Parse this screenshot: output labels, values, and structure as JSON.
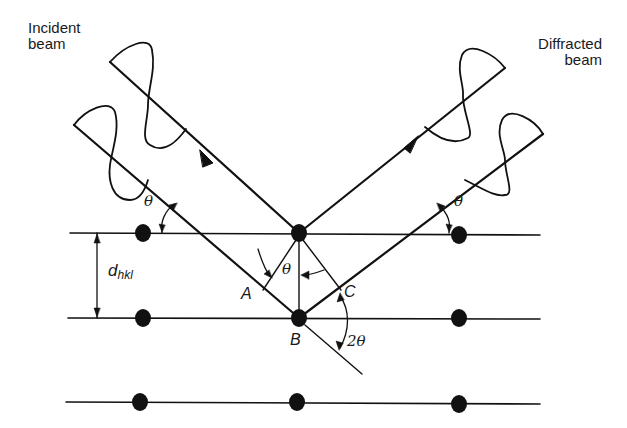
{
  "figure": {
    "colors": {
      "ink": "#111111",
      "background": "#ffffff"
    }
  },
  "labels": {
    "incident_beam_line1": "Incident",
    "incident_beam_line2": "beam",
    "diffracted_beam_line1": "Diffracted",
    "diffracted_beam_line2": "beam",
    "theta_left": "θ",
    "theta_right": "θ",
    "theta_center": "θ",
    "two_theta": "2θ",
    "point_a": "A",
    "point_b": "B",
    "point_c": "C",
    "d_spacing_main": "d",
    "d_spacing_sub": "hkl"
  },
  "lattice": {
    "planes": [
      {
        "y": 233,
        "x1": 70,
        "x2": 540
      },
      {
        "y": 318,
        "x1": 68,
        "x2": 540
      },
      {
        "y": 403,
        "x1": 66,
        "x2": 540
      }
    ],
    "atoms": [
      {
        "x": 143,
        "y": 233
      },
      {
        "x": 299,
        "y": 233
      },
      {
        "x": 459,
        "y": 235
      },
      {
        "x": 143,
        "y": 318
      },
      {
        "x": 299,
        "y": 318
      },
      {
        "x": 459,
        "y": 318
      },
      {
        "x": 140,
        "y": 402
      },
      {
        "x": 297,
        "y": 402
      },
      {
        "x": 459,
        "y": 404
      }
    ]
  },
  "beams": {
    "incident_outer": {
      "from": [
        74,
        125
      ],
      "to": [
        299,
        318
      ]
    },
    "incident_inner": {
      "from": [
        110,
        62
      ],
      "to": [
        299,
        233
      ]
    },
    "diffracted_inner": {
      "from": [
        299,
        233
      ],
      "to": [
        505,
        68
      ]
    },
    "diffracted_outer": {
      "from": [
        299,
        318
      ],
      "to": [
        543,
        134
      ]
    }
  }
}
